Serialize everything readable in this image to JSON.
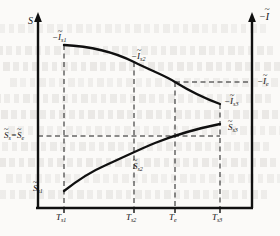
{
  "figure": {
    "name": "entropy-current-vs-temperature-diagram",
    "background_color": "#fbfaf8",
    "line_color": "#101010"
  },
  "axes": {
    "y_left_label": "S",
    "y_right_label_prefix": "−",
    "y_right_label_symbol": "I",
    "x_label": "",
    "arrow_heads": true
  },
  "x_ticks": [
    {
      "label_symbol": "T",
      "label_sub": "s1",
      "x": 64
    },
    {
      "label_symbol": "T",
      "label_sub": "s2",
      "x": 134
    },
    {
      "label_symbol": "T",
      "label_sub": "e",
      "x": 175
    },
    {
      "label_symbol": "T",
      "label_sub": "s3",
      "x": 220
    }
  ],
  "y_left_ticks": [
    {
      "symbol_a": "S",
      "sub_a": "s",
      "symbol_b": "S",
      "sub_b": "e",
      "separator": "=",
      "y": 136
    }
  ],
  "y_right_ticks": [
    {
      "prefix": "−",
      "symbol": "I",
      "sub": "e",
      "y": 82
    }
  ],
  "curve_labels": {
    "upper": [
      {
        "prefix": "−",
        "symbol": "I",
        "sub": "s1",
        "x": 52,
        "y": 37
      },
      {
        "prefix": "−",
        "symbol": "I",
        "sub": "s2",
        "x": 130,
        "y": 56
      },
      {
        "prefix": "−",
        "symbol": "I",
        "sub": "s3",
        "x": 228,
        "y": 101
      }
    ],
    "lower": [
      {
        "symbol": "S",
        "sub": "s1",
        "x": 37,
        "y": 188
      },
      {
        "symbol": "S",
        "sub": "s2",
        "x": 136,
        "y": 166
      },
      {
        "symbol": "S",
        "sub": "s3",
        "x": 231,
        "y": 131
      }
    ]
  },
  "chart_data": {
    "type": "line",
    "title": "",
    "xlabel": "T",
    "ylabel": "S",
    "y2label": "−I",
    "grid": false,
    "legend": false,
    "axis_pixel_box": {
      "left": 38,
      "right": 252,
      "top": 14,
      "bottom": 208
    },
    "x_tick_labels": [
      "T_s1",
      "T_s2",
      "T_e",
      "T_s3"
    ],
    "x_tick_pixels": [
      64,
      134,
      175,
      220
    ],
    "y_left_tick_labels": [
      "S_s = S_e"
    ],
    "y_left_tick_pixels": [
      136
    ],
    "y_right_tick_labels": [
      "-I_e"
    ],
    "y_right_tick_pixels": [
      82
    ],
    "series": [
      {
        "name": "-I (negative current, right axis)",
        "axis": "right",
        "endpoint_labels": [
          "-I_s1",
          "-I_s2",
          "-I_s3"
        ],
        "points": [
          {
            "x": 64,
            "y": 45
          },
          {
            "x": 99,
            "y": 50
          },
          {
            "x": 134,
            "y": 62
          },
          {
            "x": 155,
            "y": 71
          },
          {
            "x": 175,
            "y": 82
          },
          {
            "x": 198,
            "y": 94
          },
          {
            "x": 220,
            "y": 104
          }
        ],
        "shape": "concave-decreasing"
      },
      {
        "name": "S (entropy, left axis)",
        "axis": "left",
        "endpoint_labels": [
          "S_s1",
          "S_s2",
          "S_s3"
        ],
        "points": [
          {
            "x": 64,
            "y": 191
          },
          {
            "x": 99,
            "y": 172
          },
          {
            "x": 134,
            "y": 157
          },
          {
            "x": 155,
            "y": 147
          },
          {
            "x": 175,
            "y": 136
          },
          {
            "x": 198,
            "y": 129
          },
          {
            "x": 220,
            "y": 124
          }
        ],
        "shape": "concave-increasing"
      }
    ],
    "dashed_guides": {
      "vertical_x": [
        64,
        134,
        175,
        220
      ],
      "horizontal_left_y": [
        136
      ],
      "horizontal_right_y": [
        82
      ]
    }
  },
  "bleed_rows": [
    24,
    46,
    62,
    78,
    94,
    110,
    126,
    142,
    158,
    174,
    190
  ]
}
